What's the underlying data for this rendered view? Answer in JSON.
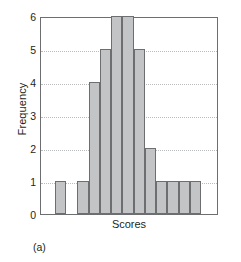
{
  "chart_data": {
    "type": "bar",
    "title": "",
    "subtitle": "",
    "xlabel": "Scores",
    "ylabel": "Frequency",
    "ylim": [
      0,
      6
    ],
    "yticks": [
      0,
      1,
      2,
      3,
      4,
      5,
      6
    ],
    "ytick_labels": [
      "0",
      "1",
      "2",
      "3",
      "4",
      "5",
      "6"
    ],
    "xtick_labels": [],
    "grid": "horizontal-dotted",
    "legend": "none",
    "bin_count": 12,
    "categories": [
      "1",
      "2",
      "3",
      "4",
      "5",
      "6",
      "7",
      "8",
      "9",
      "10",
      "11",
      "12"
    ],
    "values": [
      1,
      1,
      4,
      5,
      6,
      6,
      5,
      2,
      1,
      1,
      1,
      1
    ],
    "bin_gap_after_index": 0,
    "annotations": [
      "(a)"
    ],
    "colors": {
      "bar_fill": "#c3c4c6",
      "bar_edge": "#6d6e70",
      "frame": "#6d6e70",
      "gridline": "#b9bbbd",
      "text": "#231f20",
      "background": "#ffffff"
    }
  },
  "figure": {
    "caption": "(a)"
  }
}
